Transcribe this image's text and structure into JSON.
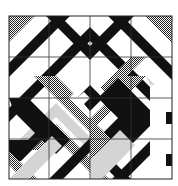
{
  "image": {
    "kind": "geometric-tile-pattern",
    "width": 178,
    "height": 186,
    "background": "#ffffff"
  },
  "frame": {
    "x": 9,
    "y": 16,
    "w": 163,
    "h": 163,
    "stroke": "#222222"
  },
  "grid": {
    "x_lines": [
      49,
      90,
      131
    ],
    "y_lines": [
      57,
      98,
      139
    ],
    "stroke": "#333333"
  },
  "colors": {
    "black": "#111111",
    "white": "#ffffff",
    "hatch": "#7a7a7a",
    "light": "#d4d4d4"
  },
  "shapes": [
    {
      "fill": "hatch",
      "points": "9,16 35,16 9,42"
    },
    {
      "fill": "black",
      "points": "9,63 56,16 70,16 9,77"
    },
    {
      "fill": "black",
      "points": "60,16 90,46 120,16 134,16 90,60 46,16"
    },
    {
      "fill": "black",
      "points": "9,108 90,27 171,108 171,122 90,41 9,122"
    },
    {
      "fill": "hatch",
      "points": "145,16 172,16 172,43"
    },
    {
      "fill": "black",
      "points": "108,16 122,16 172,66 172,80"
    },
    {
      "fill": "light",
      "points": "9,150 56,103 90,137 90,151 56,117 23,150"
    },
    {
      "fill": "hatch",
      "points": "30,150 56,124 90,158 90,172 56,138 44,150"
    },
    {
      "fill": "hatch",
      "points": "56,76 90,110 124,76 146,76 90,132 34,76"
    },
    {
      "fill": "light",
      "points": "124,76 146,76 172,102 172,85 150,85 146,76"
    },
    {
      "fill": "hatch",
      "points": "90,98 131,57 146,57 90,113"
    },
    {
      "fill": "white",
      "points": "69,98 90,77 111,98 90,119"
    },
    {
      "fill": "black",
      "points": "77,98 90,85 103,98 90,111 84,104 90,98 84,92"
    },
    {
      "fill": "black",
      "points": "9,98 28,98 70,140 56,154 14,112"
    },
    {
      "fill": "black",
      "points": "9,140 28,140 49,119 56,126 21,161 9,161"
    },
    {
      "fill": "hatch",
      "points": "9,165 23,179 37,179 9,151"
    },
    {
      "fill": "light",
      "points": "9,179 52,136 62,146 29,179"
    },
    {
      "fill": "black",
      "points": "49,179 90,138 131,179 117,179 90,152 63,179"
    },
    {
      "fill": "hatch",
      "points": "90,160 109,179 90,179"
    },
    {
      "fill": "black",
      "points": "98,98 118,78 158,118 118,158 98,138 118,118"
    },
    {
      "fill": "black",
      "points": "90,152 127,115 137,125 100,162"
    },
    {
      "fill": "hatch",
      "points": "90,118 111,139 90,160"
    },
    {
      "fill": "light",
      "points": "90,160 120,130 135,145 102,179 90,179"
    },
    {
      "fill": "black",
      "points": "112,179 150,141 150,155 126,179"
    },
    {
      "fill": "white",
      "points": "150,85 172,85 172,179 150,179"
    },
    {
      "fill": "black",
      "points": "166,112 172,112 172,124 166,124"
    },
    {
      "fill": "black",
      "points": "166,154 172,154 172,166 166,166"
    }
  ],
  "blank_patch": {
    "label": "torn / missing corner",
    "x": 150,
    "y": 85,
    "w": 22,
    "h": 94
  }
}
